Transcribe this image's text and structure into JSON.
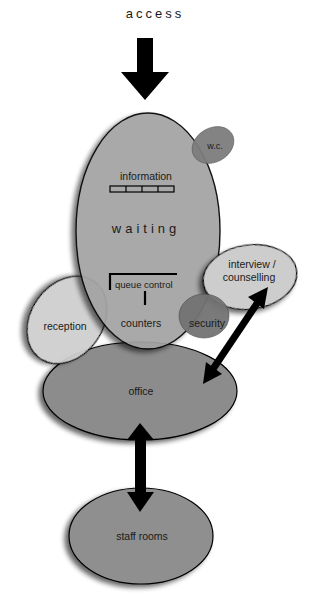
{
  "diagram": {
    "type": "bubble-adjacency-diagram",
    "entry_label": "access",
    "spaces": {
      "waiting": "waiting",
      "information": "information",
      "wc": "w.c.",
      "queue_control": "queue control",
      "counters": "counters",
      "reception": "reception",
      "security": "security",
      "interview_line1": "interview /",
      "interview_line2": "counselling",
      "office": "office",
      "staff_rooms": "staff rooms"
    },
    "connections": [
      {
        "from": "access",
        "to": "waiting",
        "type": "one-way arrow"
      },
      {
        "from": "interview / counselling",
        "to": "office",
        "type": "two-way arrow"
      },
      {
        "from": "office",
        "to": "staff rooms",
        "type": "two-way arrow"
      }
    ],
    "colors": {
      "dark_fill": "#8a8a8a",
      "mid_fill": "#9c9c9c",
      "light_fill": "#c9c9c9",
      "wc_fill": "#7a7a7a",
      "security_fill": "#707070",
      "arrow": "#000000",
      "outline": "#000000"
    }
  }
}
